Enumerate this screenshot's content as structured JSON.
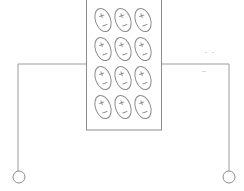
{
  "diagram": {
    "type": "capacitor-with-dielectric",
    "colors": {
      "stroke": "#8c8c8c",
      "background": "#ffffff"
    },
    "dielectric_block": {
      "x": 86,
      "y": 0,
      "width": 76,
      "height": 130
    },
    "dipoles": {
      "rows": 4,
      "columns": 3,
      "positive_symbol": "+",
      "negative_symbol": "−",
      "column_centers_x": [
        103,
        123,
        143
      ],
      "row_centers_y": [
        20,
        49,
        78,
        107
      ]
    },
    "wires": {
      "y": 64,
      "left_x": 18,
      "right_x": 229,
      "bottom_y": 171
    },
    "terminals": [
      {
        "name": "left-terminal",
        "cx": 19,
        "cy": 177,
        "r": 6
      },
      {
        "name": "right-terminal",
        "cx": 229,
        "cy": 177,
        "r": 6
      }
    ],
    "cut_off_caption": ""
  }
}
